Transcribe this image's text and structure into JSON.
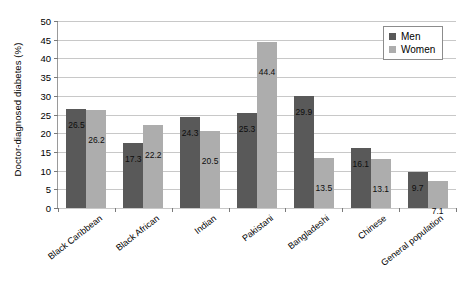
{
  "chart_data": {
    "type": "bar",
    "title": "",
    "xlabel": "",
    "ylabel": "Doctor-diagnosed diabetes (%)",
    "ylim": [
      0,
      50
    ],
    "ytick_step": 5,
    "yticks": [
      "50",
      "45",
      "40",
      "35",
      "30",
      "25",
      "20",
      "15",
      "10",
      "5",
      "0"
    ],
    "grid": true,
    "legend_position": "top-right",
    "categories": [
      "Black Caribbean",
      "Black African",
      "Indian",
      "Pakistani",
      "Bangladeshi",
      "Chinese",
      "General population"
    ],
    "series": [
      {
        "name": "Men",
        "color": "#595959",
        "values": [
          26.5,
          17.3,
          24.3,
          25.3,
          29.9,
          16.1,
          9.7
        ],
        "labels": [
          "26.5",
          "17.3",
          "24.3",
          "25.3",
          "29.9",
          "16.1",
          "9.7"
        ]
      },
      {
        "name": "Women",
        "color": "#adadad",
        "values": [
          26.2,
          22.2,
          20.5,
          44.4,
          13.5,
          13.1,
          7.1
        ],
        "labels": [
          "26.2",
          "22.2",
          "20.5",
          "44.4",
          "13.5",
          "13.1",
          "7.1"
        ]
      }
    ]
  },
  "legend": {
    "items": [
      {
        "label": "Men",
        "swatch": "men-swatch"
      },
      {
        "label": "Women",
        "swatch": "women-swatch"
      }
    ]
  },
  "colors": {
    "men": "#595959",
    "women": "#adadad",
    "gridline": "#c8c8c8",
    "axis": "#9a9a9a",
    "text": "#000000"
  }
}
